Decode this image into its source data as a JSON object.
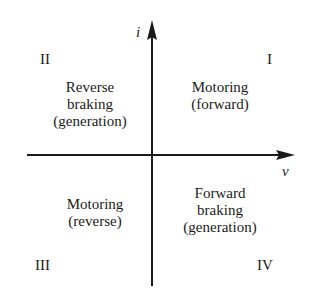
{
  "axes": {
    "vertical_label": "i",
    "horizontal_label": "v",
    "color": "#1a1a1a"
  },
  "quadrants": [
    {
      "numeral": "I",
      "lines": [
        "Motoring",
        "(forward)"
      ]
    },
    {
      "numeral": "II",
      "lines": [
        "Reverse",
        "braking",
        "(generation)"
      ]
    },
    {
      "numeral": "III",
      "lines": [
        "Motoring",
        "(reverse)"
      ]
    },
    {
      "numeral": "IV",
      "lines": [
        "Forward",
        "braking",
        "(generation)"
      ]
    }
  ]
}
